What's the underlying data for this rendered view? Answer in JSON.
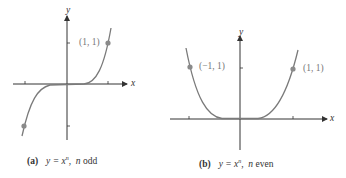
{
  "figures": [
    {
      "id": "a",
      "label": "(a)",
      "equation": "y = x",
      "exponent": "n",
      "condition_var": "n",
      "condition_text": "odd",
      "axis_x": "x",
      "axis_y": "y",
      "points": [
        {
          "label": "(1, 1)",
          "x": 1,
          "y": 1
        },
        {
          "label": "",
          "x": -1,
          "y": -1
        }
      ]
    },
    {
      "id": "b",
      "label": "(b)",
      "equation": "y = x",
      "exponent": "n",
      "condition_var": "n",
      "condition_text": "even",
      "axis_x": "x",
      "axis_y": "y",
      "points": [
        {
          "label": "(−1, 1)",
          "x": -1,
          "y": 1
        },
        {
          "label": "(1, 1)",
          "x": 1,
          "y": 1
        }
      ]
    }
  ],
  "colors": {
    "curve": "#7a7a7a",
    "axis": "#333333",
    "point": "#8a8a8a",
    "label": "#777777"
  }
}
